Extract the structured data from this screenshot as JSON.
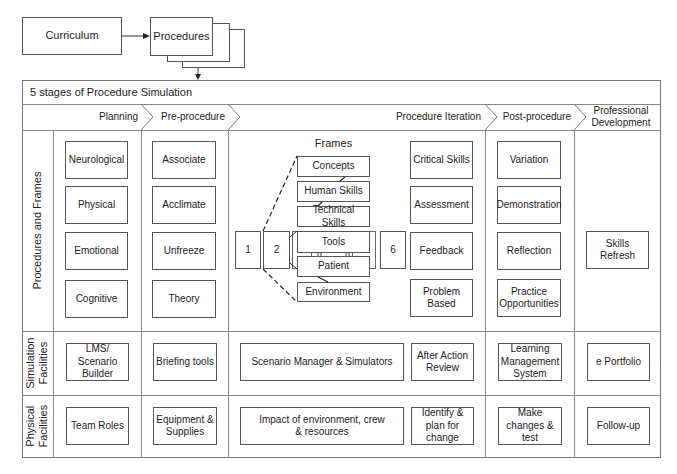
{
  "top": {
    "curriculum": "Curriculum",
    "procedures": "Procedures"
  },
  "title": "5 stages of Procedure Simulation",
  "stages": [
    {
      "label": "Planning"
    },
    {
      "label": "Pre-procedure"
    },
    {
      "label": "Procedure Iteration"
    },
    {
      "label": "Post-procedure"
    },
    {
      "label": "Professional Development"
    }
  ],
  "rows": {
    "procedures_frames": "Procedures and Frames",
    "simulation_facilities": "Simulation Facilities",
    "physical_facilities": "Physical Facilities"
  },
  "planning": [
    "Neurological",
    "Physical",
    "Emotional",
    "Cognitive"
  ],
  "preprocedure": [
    "Associate",
    "Acclimate",
    "Unfreeze",
    "Theory"
  ],
  "frames": {
    "title": "Frames",
    "items": [
      "Concepts",
      "Human Skills",
      "Technical Skills",
      "Tools",
      "Patient",
      "Environment"
    ],
    "steps": [
      "1",
      "2",
      "6"
    ]
  },
  "iteration": [
    "Critical Skills",
    "Assessment",
    "Feedback",
    "Problem Based"
  ],
  "postprocedure": [
    "Variation",
    "Demonstration",
    "Reflection",
    "Practice Opportunities"
  ],
  "professional": [
    "Skills Refresh"
  ],
  "simulation": {
    "planning": "LMS/ Scenario Builder",
    "preprocedure": "Briefing tools",
    "iteration_main": "Scenario Manager & Simulators",
    "iteration_side": "After Action Review",
    "postprocedure": "Learning Management System",
    "professional": "e Portfolio"
  },
  "physical": {
    "planning": "Team Roles",
    "preprocedure": "Equipment & Supplies",
    "iteration_main": "Impact of environment, crew & resources",
    "iteration_side": "Identify & plan for change",
    "postprocedure": "Make changes & test",
    "professional": "Follow-up"
  }
}
